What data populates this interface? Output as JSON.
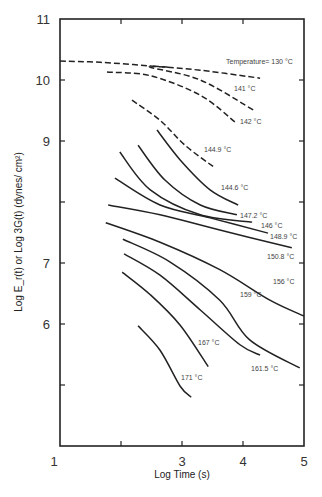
{
  "chart_data": {
    "type": "line",
    "title": "",
    "xlabel": "Log Time (s)",
    "ylabel": "Log E_r(t) or Log 3G(t) (dynes/ cm²)",
    "xlim": [
      1,
      5
    ],
    "ylim": [
      4,
      11
    ],
    "x_ticks": [
      "1",
      "3",
      "4",
      "5"
    ],
    "x_tick_values": [
      1,
      2,
      3,
      4,
      5
    ],
    "y_ticks": [
      "11",
      "10",
      "9",
      "7",
      "6"
    ],
    "y_tick_values": [
      11,
      10,
      9,
      8,
      7,
      6,
      5
    ],
    "grid": false,
    "legend": "inline labels",
    "series": [
      {
        "name": "Temperature= 130 °C",
        "style": "dashed",
        "x": [
          1.0,
          1.66,
          2.48,
          3.3,
          4.28
        ],
        "y": [
          10.31,
          10.29,
          10.23,
          10.16,
          10.03
        ]
      },
      {
        "name": "141 °C",
        "style": "dashed",
        "x": [
          2.77,
          2.48,
          3.3,
          4.2
        ],
        "y": [
          10.21,
          10.21,
          10.0,
          9.49
        ]
      },
      {
        "name": "142 °C",
        "style": "dashed",
        "x": [
          1.77,
          2.48,
          3.3,
          3.87
        ],
        "y": [
          10.13,
          10.07,
          9.75,
          9.31
        ]
      },
      {
        "name": "144.9 °C",
        "style": "dashed",
        "x": [
          2.18,
          2.64,
          3.05,
          3.54
        ],
        "y": [
          9.67,
          9.34,
          8.93,
          8.56
        ]
      },
      {
        "name": "144.6 °C",
        "style": "solid",
        "x": [
          2.59,
          2.97,
          3.46,
          3.92
        ],
        "y": [
          9.18,
          8.69,
          8.2,
          7.95
        ]
      },
      {
        "name": "147.2 °C",
        "style": "solid",
        "x": [
          2.28,
          2.72,
          3.3,
          3.9
        ],
        "y": [
          8.93,
          8.36,
          7.95,
          7.79
        ]
      },
      {
        "name": "146 °C",
        "style": "solid",
        "x": [
          1.98,
          2.48,
          3.3,
          4.15
        ],
        "y": [
          8.82,
          8.2,
          7.79,
          7.67
        ]
      },
      {
        "name": "148.9 °C",
        "style": "solid",
        "x": [
          1.9,
          2.64,
          3.46,
          4.41
        ],
        "y": [
          8.39,
          7.95,
          7.74,
          7.49
        ]
      },
      {
        "name": "150.8 °C",
        "style": "solid",
        "x": [
          1.79,
          2.64,
          3.62,
          4.8
        ],
        "y": [
          7.95,
          7.79,
          7.54,
          7.25
        ]
      },
      {
        "name": "156 °C",
        "style": "solid",
        "x": [
          1.75,
          2.64,
          3.62,
          4.44,
          5.0
        ],
        "y": [
          7.66,
          7.34,
          6.89,
          6.39,
          6.13
        ]
      },
      {
        "name": "159 °C",
        "style": "solid",
        "x": [
          2.03,
          2.8,
          3.62,
          4.11,
          4.93
        ],
        "y": [
          7.39,
          7.02,
          6.39,
          5.74,
          5.28
        ]
      },
      {
        "name": "161.5 °C",
        "style": "solid",
        "x": [
          2.05,
          2.64,
          3.3,
          3.95,
          4.28
        ],
        "y": [
          7.15,
          6.8,
          6.23,
          5.66,
          5.49
        ]
      },
      {
        "name": "167 °C",
        "style": "solid",
        "x": [
          2.02,
          2.48,
          2.97,
          3.43
        ],
        "y": [
          6.85,
          6.48,
          5.98,
          5.3
        ]
      },
      {
        "name": "171 °C",
        "style": "solid",
        "x": [
          2.28,
          2.64,
          2.97,
          3.15
        ],
        "y": [
          5.97,
          5.57,
          4.98,
          4.8
        ]
      }
    ]
  }
}
